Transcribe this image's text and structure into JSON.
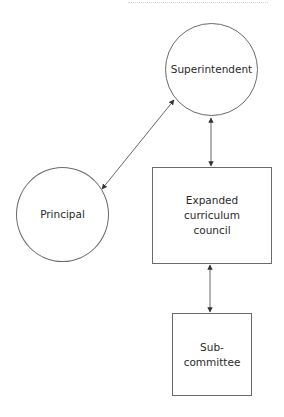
{
  "diagram": {
    "type": "organizational-flow",
    "nodes": [
      {
        "id": "superintendent",
        "shape": "circle",
        "label": "Superintendent"
      },
      {
        "id": "principal",
        "shape": "circle",
        "label": "Principal"
      },
      {
        "id": "council",
        "shape": "rectangle",
        "label": "Expanded\ncurriculum\ncouncil"
      },
      {
        "id": "subcommittee",
        "shape": "rectangle",
        "label": "Sub-\ncommittee"
      }
    ],
    "edges": [
      {
        "from": "principal",
        "to": "superintendent",
        "direction": "bidirectional"
      },
      {
        "from": "superintendent",
        "to": "council",
        "direction": "bidirectional"
      },
      {
        "from": "council",
        "to": "subcommittee",
        "direction": "bidirectional"
      }
    ]
  },
  "colors": {
    "stroke": "#6a6a6a",
    "arrow": "#333333",
    "background": "#ffffff"
  }
}
